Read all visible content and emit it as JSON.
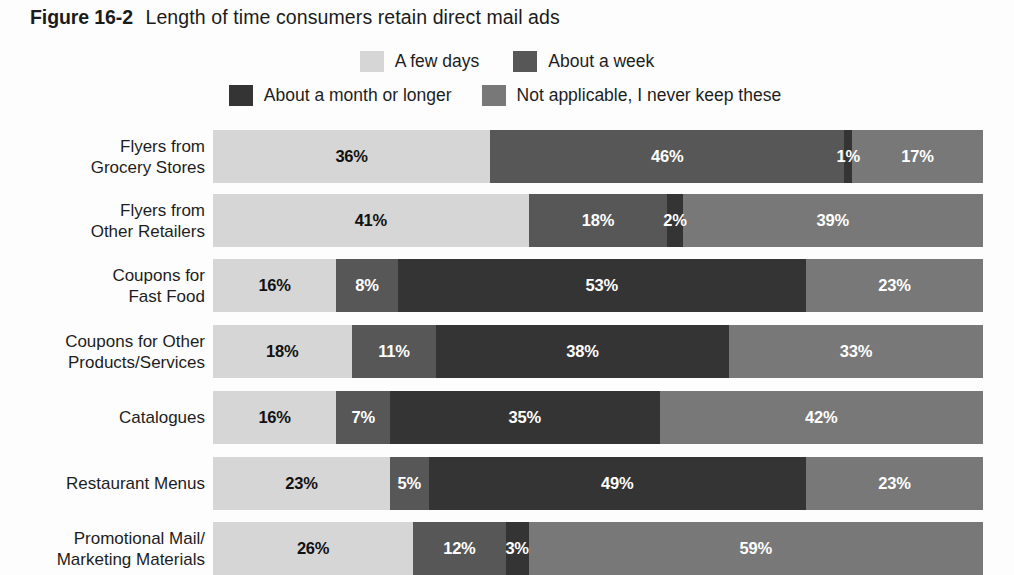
{
  "title": {
    "figure_number": "Figure 16-2",
    "caption": "Length of time consumers retain direct mail ads"
  },
  "legend": {
    "rows": [
      [
        {
          "label": "A few days",
          "color": "#d6d6d6"
        },
        {
          "label": "About a week",
          "color": "#575757"
        }
      ],
      [
        {
          "label": "About a month or longer",
          "color": "#343434"
        },
        {
          "label": "Not applicable, I never keep these",
          "color": "#787878"
        }
      ]
    ]
  },
  "chart_data": {
    "type": "bar",
    "orientation": "horizontal",
    "stacked": true,
    "stacked_percent": true,
    "title": "Figure 16-2 Length of time consumers retain direct mail ads",
    "xlabel": "",
    "ylabel": "",
    "xlim": [
      0,
      100
    ],
    "grid": false,
    "legend_position": "top",
    "value_suffix": "%",
    "categories": [
      "Flyers from Grocery Stores",
      "Flyers from Other Retailers",
      "Coupons for Fast Food",
      "Coupons for Other Products/Services",
      "Catalogues",
      "Restaurant Menus",
      "Promotional Mail/Marketing Materials"
    ],
    "category_lines": [
      [
        "Flyers from",
        "Grocery Stores"
      ],
      [
        "Flyers from",
        "Other Retailers"
      ],
      [
        "Coupons for",
        "Fast Food"
      ],
      [
        "Coupons for Other",
        "Products/Services"
      ],
      [
        "Catalogues"
      ],
      [
        "Restaurant Menus"
      ],
      [
        "Promotional Mail/",
        "Marketing Materials"
      ]
    ],
    "series": [
      {
        "name": "A few days",
        "color": "#d6d6d6",
        "text_on_fill": "dark",
        "values": [
          36,
          41,
          16,
          18,
          16,
          23,
          26
        ],
        "labels": [
          "36%",
          "41%",
          "16%",
          "18%",
          "16%",
          "23%",
          "26%"
        ]
      },
      {
        "name": "About a week",
        "color": "#575757",
        "text_on_fill": "light",
        "values": [
          46,
          18,
          8,
          11,
          7,
          5,
          12
        ],
        "labels": [
          "46%",
          "18%",
          "8%",
          "11%",
          "7%",
          "5%",
          "12%"
        ]
      },
      {
        "name": "About a month or longer",
        "color": "#343434",
        "text_on_fill": "light",
        "values": [
          1,
          2,
          53,
          38,
          35,
          49,
          3
        ],
        "labels": [
          "1%",
          "2%",
          "53%",
          "38%",
          "35%",
          "49%",
          "3%"
        ]
      },
      {
        "name": "Not applicable, I never keep these",
        "color": "#787878",
        "text_on_fill": "light",
        "values": [
          17,
          39,
          23,
          33,
          42,
          23,
          59
        ],
        "labels": [
          "17%",
          "39%",
          "23%",
          "33%",
          "42%",
          "23%",
          "59%"
        ]
      }
    ]
  }
}
